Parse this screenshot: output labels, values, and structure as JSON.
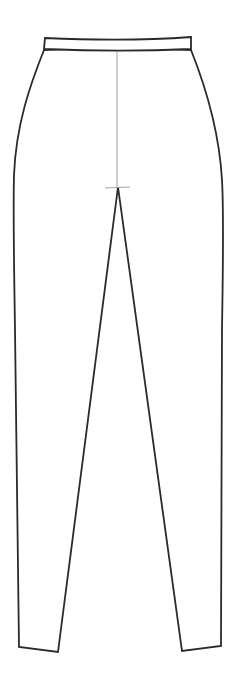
{
  "figure": {
    "view": "front",
    "colors": {
      "background": "#ffffff",
      "outline": "#2a2a2a",
      "center_seam": "#8a8a8a"
    },
    "parts": [
      {
        "name": "waistband"
      },
      {
        "name": "left-leg"
      },
      {
        "name": "right-leg"
      },
      {
        "name": "center-front-seam"
      },
      {
        "name": "crotch-marker"
      }
    ]
  }
}
